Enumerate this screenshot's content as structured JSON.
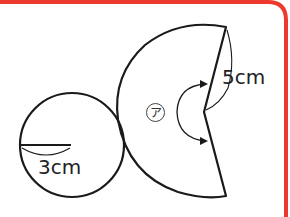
{
  "figure": {
    "circle": {
      "radius_label": "3cm"
    },
    "sector": {
      "side_label": "5cm",
      "angle_marker": "ア"
    }
  },
  "colors": {
    "border": "#ee3a2e",
    "line": "#1a1a1a",
    "background": "#ffffff"
  }
}
